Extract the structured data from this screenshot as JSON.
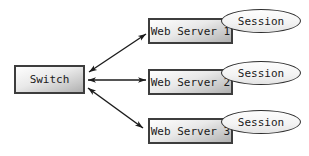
{
  "diagram": {
    "type": "network-topology",
    "nodes": {
      "switch": {
        "label": "Switch",
        "shape": "rectangle"
      },
      "servers": [
        {
          "label": "Web Server 1",
          "shape": "rectangle",
          "session_label": "Session",
          "session_shape": "ellipse"
        },
        {
          "label": "Web Server 2",
          "shape": "rectangle",
          "session_label": "Session",
          "session_shape": "ellipse"
        },
        {
          "label": "Web Server 3",
          "shape": "rectangle",
          "session_label": "Session",
          "session_shape": "ellipse"
        }
      ]
    },
    "edges": [
      {
        "from": "Switch",
        "to": "Web Server 1",
        "bidirectional": true
      },
      {
        "from": "Switch",
        "to": "Web Server 2",
        "bidirectional": true
      },
      {
        "from": "Switch",
        "to": "Web Server 3",
        "bidirectional": true
      }
    ],
    "colors": {
      "background": "#ffffff",
      "box_border": "#3d3d3d",
      "box_fill_light": "#fefefe",
      "box_fill_dark": "#b0b0b0",
      "ellipse_border": "#2e2e2e",
      "ellipse_fill": "#f6f6f6",
      "arrow": "#1c1c1c",
      "text": "#1a1a1a"
    }
  }
}
